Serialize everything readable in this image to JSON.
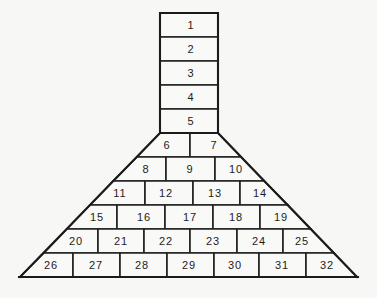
{
  "diagram": {
    "chimney_cells": [
      "1",
      "2",
      "3",
      "4",
      "5"
    ],
    "pyramid_rows": [
      [
        "6",
        "7"
      ],
      [
        "8",
        "9",
        "10"
      ],
      [
        "11",
        "12",
        "13",
        "14"
      ],
      [
        "15",
        "16",
        "17",
        "18",
        "19"
      ],
      [
        "20",
        "21",
        "22",
        "23",
        "24",
        "25"
      ],
      [
        "26",
        "27",
        "28",
        "29",
        "30",
        "31",
        "32"
      ]
    ],
    "colors": {
      "line": "#1c1c1c",
      "background": "#f7f7f5",
      "cell_fill": "#f9f9f7"
    }
  }
}
